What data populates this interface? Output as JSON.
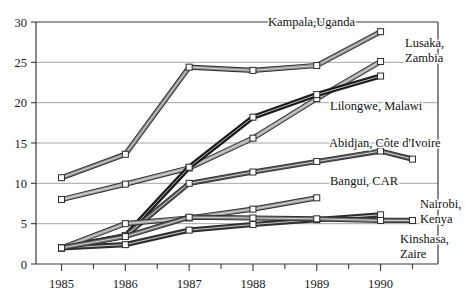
{
  "chart_data": {
    "type": "line",
    "title": "",
    "subtitle": "",
    "xlabel": "",
    "ylabel": "",
    "x": [
      1985,
      1986,
      1987,
      1988,
      1989,
      1990,
      1990.5
    ],
    "categories": [
      "1985",
      "1986",
      "1987",
      "1988",
      "1989",
      "1990"
    ],
    "xlim": [
      1984.6,
      1990.9
    ],
    "ylim": [
      0,
      30
    ],
    "yticks": [
      0,
      5,
      10,
      15,
      20,
      25,
      30
    ],
    "ytick_labels": [
      "0",
      "5",
      "10",
      "15",
      "20",
      "25",
      "30"
    ],
    "xticks": [
      1985,
      1985.5,
      1986,
      1986.5,
      1987,
      1987.5,
      1988,
      1988.5,
      1989,
      1989.5,
      1990,
      1990.5
    ],
    "xtick_labels": [
      "1985",
      "1986",
      "1987",
      "1988",
      "1989",
      "1990"
    ],
    "grid": "horizontal",
    "legend": "inline-labels",
    "markers": "open-square",
    "series": [
      {
        "name": "Kampala,Uganda",
        "label": "Kampala,Uganda",
        "color": "#8c8c8c",
        "label_x": 268,
        "label_y": 26,
        "x": [
          1985,
          1986,
          1987,
          1988,
          1989,
          1990
        ],
        "values": [
          10.7,
          13.6,
          24.4,
          24.0,
          24.6,
          28.8
        ]
      },
      {
        "name": "Lusaka, Zambia",
        "label": "Lusaka,",
        "label2": "Zambia",
        "color": "#a8a8a8",
        "label_x": 405,
        "label_y": 47,
        "label2_y": 62,
        "x": [
          1985,
          1986,
          1987,
          1988,
          1989,
          1990
        ],
        "values": [
          8.0,
          9.9,
          11.9,
          15.6,
          20.5,
          25.1
        ]
      },
      {
        "name": "Lilongwe, Malawi",
        "label": "Lilongwe, Malawi",
        "color": "#111111",
        "label_x": 330,
        "label_y": 110,
        "x": [
          1985,
          1986,
          1987,
          1988,
          1989,
          1990
        ],
        "values": [
          2.0,
          3.5,
          12.0,
          18.2,
          21.0,
          23.3
        ]
      },
      {
        "name": "Abidjan, Côte d'Ivoire",
        "label": "Abidjan, Côte d'Ivoire",
        "color": "#595959",
        "label_x": 329,
        "label_y": 147,
        "x": [
          1985,
          1986,
          1987,
          1988,
          1989,
          1990,
          1990.5
        ],
        "values": [
          2.0,
          3.5,
          10.0,
          11.4,
          12.7,
          14.0,
          13.0
        ]
      },
      {
        "name": "Bangui, CAR",
        "label": "Bangui, CAR",
        "color": "#9a9a9a",
        "label_x": 330,
        "label_y": 185,
        "x": [
          1985,
          1986,
          1987,
          1988,
          1989
        ],
        "values": [
          2.0,
          5.0,
          5.7,
          6.8,
          8.2
        ]
      },
      {
        "name": "Nairobi, Kenya",
        "label": "Nairobi,",
        "label2": "Kenya",
        "color": "#333333",
        "label_x": 420,
        "label_y": 208,
        "label2_y": 223,
        "x": [
          1985,
          1986,
          1987,
          1988,
          1989,
          1990
        ],
        "values": [
          2.0,
          2.4,
          4.2,
          4.9,
          5.5,
          6.1
        ]
      },
      {
        "name": "Kinshasa, Zaire",
        "label": "Kinshasa,",
        "label2": "Zaire",
        "color": "#707070",
        "label_x": 400,
        "label_y": 243,
        "label2_y": 258,
        "x": [
          1985,
          1986,
          1987,
          1988,
          1989,
          1990,
          1990.5
        ],
        "values": [
          2.0,
          3.4,
          5.8,
          5.7,
          5.6,
          5.4,
          5.4
        ]
      }
    ]
  },
  "axes": {
    "y_labels": [
      "30",
      "25",
      "20",
      "15",
      "10",
      "5",
      "0"
    ],
    "x_labels": [
      "1985",
      "1986",
      "1987",
      "1988",
      "1989",
      "1990"
    ]
  }
}
